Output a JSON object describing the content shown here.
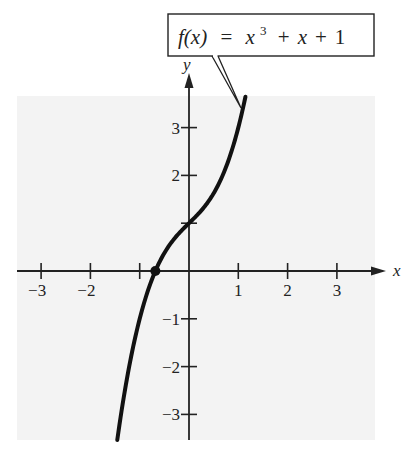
{
  "chart_data": {
    "type": "line",
    "title": "",
    "function_label": {
      "lhs": "f(x)",
      "equals": "=",
      "rhs_base": "x",
      "rhs_exp": "3",
      "rhs_rest": "+ x + 1",
      "text": "f(x) = x^3 + x + 1"
    },
    "xlabel": "x",
    "ylabel": "y",
    "x_ticks": [
      -3,
      -2,
      -1,
      1,
      2,
      3
    ],
    "x_tick_labels": [
      "−3",
      "−2",
      "",
      "1",
      "2",
      "3"
    ],
    "y_ticks": [
      -3,
      -2,
      -1,
      1,
      2,
      3
    ],
    "y_tick_labels": [
      "−3",
      "−2",
      "−1",
      "",
      "2",
      "3"
    ],
    "xlim": [
      -3.5,
      3.8
    ],
    "ylim": [
      -3.5,
      3.65
    ],
    "grid": false,
    "series": [
      {
        "name": "f(x) = x^3 + x + 1",
        "expression": "x^3 + x + 1",
        "x_range": [
          -1.455,
          1.145
        ],
        "x": [
          -1.455,
          -1.2,
          -1.0,
          -0.8,
          -0.6823,
          -0.5,
          -0.25,
          0,
          0.25,
          0.5,
          0.75,
          1.0,
          1.145
        ],
        "y": [
          -3.535,
          -1.928,
          -1.0,
          -0.312,
          0.0,
          0.375,
          0.734,
          1.0,
          1.266,
          1.625,
          2.172,
          3.0,
          3.646
        ]
      }
    ],
    "annotations": [
      {
        "type": "point",
        "label": "x-intercept",
        "x": -0.6823,
        "y": 0
      },
      {
        "type": "callout",
        "text": "f(x) = x^3 + x + 1",
        "points_to": [
          1.05,
          3.2
        ]
      }
    ],
    "colors": {
      "panel": "#f3f3f3",
      "curve": "#111111",
      "axes": "#222222"
    }
  }
}
